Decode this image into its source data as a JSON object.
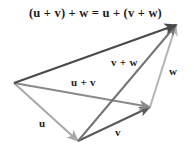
{
  "figure": {
    "title_equation": "(u + v) + w = u + (v + w)",
    "background_color": "#ffffff",
    "width": 194,
    "height": 156
  },
  "labels": {
    "u_plus_v": "u + v",
    "v_plus_w": "v + w",
    "w": "w",
    "u": "u",
    "v": "v"
  },
  "colors": {
    "resultant": "#4a4a4a",
    "u_plus_v": "#8a8a8a",
    "v_plus_w": "#757575",
    "u": "#a8a8a8",
    "v": "#5a5a5a",
    "w": "#b4b4b4",
    "text": "#1c1c1c"
  },
  "chart_data": {
    "type": "diagram",
    "title": "(u + v) + w = u + (v + w)",
    "points": {
      "origin": [
        14,
        83
      ],
      "u_tip": [
        78,
        141
      ],
      "uv_tip": [
        150,
        107
      ],
      "sum_tip": [
        176,
        25
      ]
    },
    "vectors": [
      {
        "name": "u",
        "label": "u",
        "from": [
          14,
          83
        ],
        "to": [
          78,
          141
        ],
        "color": "#a8a8a8",
        "width": 2.0,
        "arrow": true
      },
      {
        "name": "v",
        "label": "v",
        "from": [
          78,
          141
        ],
        "to": [
          150,
          107
        ],
        "color": "#5a5a5a",
        "width": 2.0,
        "arrow": true
      },
      {
        "name": "w",
        "label": "w",
        "from": [
          150,
          107
        ],
        "to": [
          176,
          25
        ],
        "color": "#b4b4b4",
        "width": 2.0,
        "arrow": true
      },
      {
        "name": "u_plus_v",
        "label": "u + v",
        "from": [
          14,
          83
        ],
        "to": [
          150,
          107
        ],
        "color": "#8a8a8a",
        "width": 2.0,
        "arrow": true
      },
      {
        "name": "v_plus_w",
        "label": "v + w",
        "from": [
          78,
          141
        ],
        "to": [
          176,
          25
        ],
        "color": "#757575",
        "width": 2.0,
        "arrow": true
      },
      {
        "name": "resultant",
        "label": "",
        "from": [
          14,
          83
        ],
        "to": [
          176,
          25
        ],
        "color": "#4a4a4a",
        "width": 2.2,
        "arrow": true
      }
    ]
  }
}
